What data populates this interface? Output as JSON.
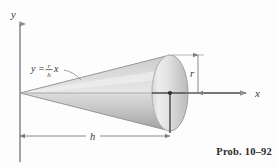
{
  "figure": {
    "caption": "Prob. 10–92",
    "axes": {
      "y_label": "y",
      "x_label": "x"
    },
    "equation": {
      "lhs": "y",
      "equals": "=",
      "numerator": "r",
      "denominator": "h",
      "variable": "x",
      "full_text": "y = (r/h)x"
    },
    "dimensions": {
      "radius_label": "r",
      "height_label": "h"
    },
    "colors": {
      "background": "#fdfdfd",
      "axis": "#8d8d8d",
      "ink": "#3b3b3b",
      "cone_light": "#f2f2f2",
      "cone_mid": "#cfcfcf",
      "cone_dark": "#a9a9a9",
      "ellipse_light": "#efefef",
      "ellipse_dark": "#b5b5b5",
      "dimension_line": "#9a9a9a"
    },
    "geometry": {
      "apex_x": 20,
      "apex_y": 93,
      "base_center_x": 170,
      "base_center_y": 93,
      "base_rx": 18,
      "base_ry": 38
    }
  }
}
